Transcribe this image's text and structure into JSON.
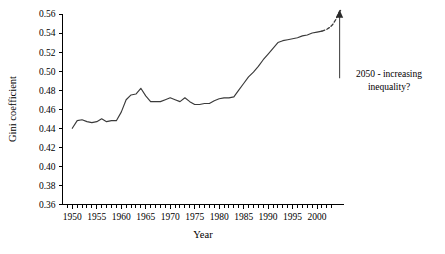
{
  "chart_data": {
    "type": "line",
    "title": "",
    "xlabel": "Year",
    "ylabel": "Gini coefficient",
    "xlim": [
      1948,
      2005.5
    ],
    "ylim": [
      0.36,
      0.56
    ],
    "grid": false,
    "legend": null,
    "x_ticks_major": [
      1950,
      1955,
      1960,
      1965,
      1970,
      1975,
      1980,
      1985,
      1990,
      1995,
      2000
    ],
    "x_tick_labels": [
      "1950",
      "1955",
      "1960",
      "1965",
      "1970",
      "1975",
      "1980",
      "1985",
      "1990",
      "1995",
      "2000"
    ],
    "x_minor_tick_step": 1,
    "y_ticks": [
      0.36,
      0.38,
      0.4,
      0.42,
      0.44,
      0.46,
      0.48,
      0.5,
      0.52,
      0.54,
      0.56
    ],
    "y_tick_labels": [
      "0.36",
      "0.38",
      "0.40",
      "0.42",
      "0.44",
      "0.46",
      "0.48",
      "0.50",
      "0.52",
      "0.54",
      "0.56"
    ],
    "series": [
      {
        "name": "Gini coefficient (observed)",
        "style": "solid",
        "color": "#3a3a3a",
        "x": [
          1950,
          1951,
          1952,
          1953,
          1954,
          1955,
          1956,
          1957,
          1958,
          1959,
          1960,
          1961,
          1962,
          1963,
          1964,
          1965,
          1966,
          1967,
          1968,
          1969,
          1970,
          1971,
          1972,
          1973,
          1974,
          1975,
          1976,
          1977,
          1978,
          1979,
          1980,
          1981,
          1982,
          1983,
          1984,
          1985,
          1986,
          1987,
          1988,
          1989,
          1990,
          1991,
          1992,
          1993,
          1994,
          1995,
          1996,
          1997,
          1998,
          1999,
          2000,
          2001
        ],
        "y": [
          0.44,
          0.448,
          0.449,
          0.447,
          0.446,
          0.447,
          0.45,
          0.447,
          0.448,
          0.448,
          0.457,
          0.47,
          0.475,
          0.476,
          0.482,
          0.474,
          0.468,
          0.468,
          0.468,
          0.47,
          0.472,
          0.47,
          0.468,
          0.472,
          0.468,
          0.465,
          0.465,
          0.466,
          0.466,
          0.469,
          0.471,
          0.472,
          0.472,
          0.473,
          0.48,
          0.487,
          0.494,
          0.499,
          0.505,
          0.512,
          0.518,
          0.524,
          0.53,
          0.532,
          0.533,
          0.534,
          0.535,
          0.537,
          0.538,
          0.54,
          0.541,
          0.542
        ]
      },
      {
        "name": "Projection",
        "style": "dashed",
        "color": "#3a3a3a",
        "x": [
          2001,
          2002,
          2002.6,
          2003.2,
          2003.8,
          2004.4,
          2005
        ],
        "y": [
          0.542,
          0.544,
          0.546,
          0.549,
          0.554,
          0.561,
          0.565
        ]
      }
    ],
    "annotations": [
      {
        "name": "projection-callout",
        "lines": [
          "2050 - increasing",
          "inequality?"
        ],
        "text": "2050 - increasing inequality?",
        "arrow": {
          "direction": "up",
          "at_year": 2004.6,
          "from_value": 0.4925,
          "to_value": 0.5635
        }
      }
    ]
  }
}
